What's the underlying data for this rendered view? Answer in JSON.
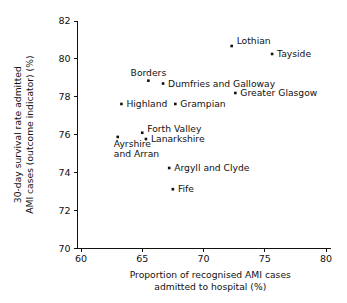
{
  "chart_data": {
    "type": "scatter",
    "title": "",
    "xlabel": "Proportion of recognised AMI cases admitted to hospital (%)",
    "xlabel_line1": "Proportion of recognised AMI cases",
    "xlabel_line2": "admitted to hospital (%)",
    "ylabel": "30-day survival rate admitted AMI cases (outcome indicator) (%)",
    "ylabel_line1": "30-day survival rate admitted",
    "ylabel_line2": "AMI cases (outcome indicator) (%)",
    "xlim": [
      60,
      80
    ],
    "ylim": [
      70,
      82
    ],
    "xticks": [
      60,
      65,
      70,
      75,
      80
    ],
    "yticks": [
      70,
      72,
      74,
      76,
      78,
      80,
      82
    ],
    "grid": false,
    "legend": "none",
    "marker_color": "#111111",
    "points": [
      {
        "label": "Lothian",
        "x": 72.3,
        "y": 80.68,
        "label_pos": "right",
        "label_dx": 5,
        "label_dy": -2
      },
      {
        "label": "Tayside",
        "x": 75.6,
        "y": 80.26,
        "label_pos": "right",
        "label_dx": 5,
        "label_dy": 3
      },
      {
        "label": "Borders",
        "x": 65.5,
        "y": 78.85,
        "label_pos": "above",
        "label_dx": 0,
        "label_dy": -5
      },
      {
        "label": "Dumfries and Galloway",
        "x": 66.7,
        "y": 78.7,
        "label_pos": "right",
        "label_dx": 5,
        "label_dy": 3
      },
      {
        "label": "Greater Glasgow",
        "x": 72.6,
        "y": 78.2,
        "label_pos": "right",
        "label_dx": 5,
        "label_dy": 3
      },
      {
        "label": "Highland",
        "x": 63.3,
        "y": 77.62,
        "label_pos": "right",
        "label_dx": 5,
        "label_dy": 3
      },
      {
        "label": "Grampian",
        "x": 67.7,
        "y": 77.62,
        "label_pos": "right",
        "label_dx": 5,
        "label_dy": 3
      },
      {
        "label": "Forth Valley",
        "x": 65.0,
        "y": 76.1,
        "label_pos": "right",
        "label_dx": 5,
        "label_dy": -1
      },
      {
        "label": "Ayrshire and Arran",
        "x": 63.0,
        "y": 75.88,
        "label_pos": "below",
        "label_dx": 0,
        "label_dy": 10
      },
      {
        "label": "Lanarkshire",
        "x": 65.3,
        "y": 75.77,
        "label_pos": "right",
        "label_dx": 5,
        "label_dy": 3
      },
      {
        "label": "Argyll and Clyde",
        "x": 67.2,
        "y": 74.24,
        "label_pos": "right",
        "label_dx": 5,
        "label_dy": 3
      },
      {
        "label": "Fife",
        "x": 67.5,
        "y": 73.12,
        "label_pos": "right",
        "label_dx": 5,
        "label_dy": 3
      }
    ]
  },
  "labels": {
    "ayrshire_line1": "Ayrshire",
    "ayrshire_line2": "and Arran"
  },
  "caption": {
    "cropped_text": ""
  }
}
